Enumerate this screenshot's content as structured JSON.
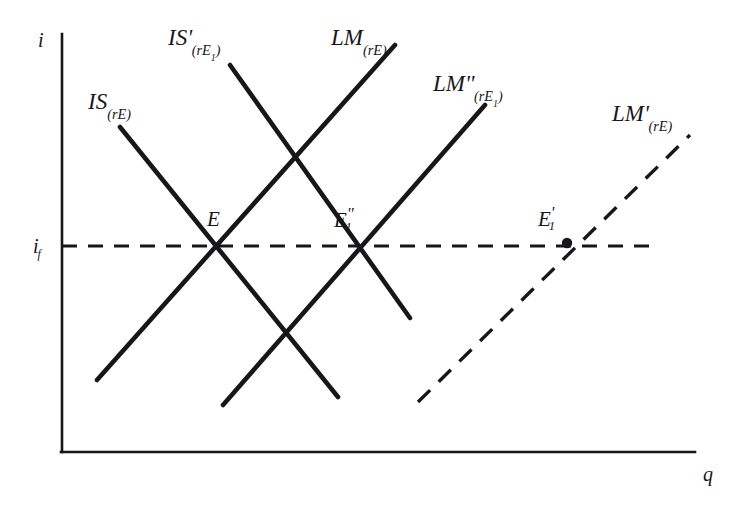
{
  "figure": {
    "type": "is-lm-diagram",
    "background_color": "#ffffff",
    "line_color": "#17171a",
    "axes": {
      "y_axis_label": "i",
      "x_axis_label": "q",
      "y_tick_label": "i",
      "y_tick_sub": "f",
      "origin_px": [
        62,
        452
      ],
      "y_axis_top_px": [
        62,
        34
      ],
      "x_axis_right_px": [
        695,
        452
      ]
    },
    "curves": [
      {
        "id": "IS",
        "label_base": "IS",
        "label_prime": "",
        "label_sub": "(rE)",
        "style": "solid",
        "slope": "negative",
        "from_px": [
          120,
          127
        ],
        "to_px": [
          338,
          397
        ],
        "label_px": [
          88,
          92
        ]
      },
      {
        "id": "IS-prime",
        "label_base": "IS",
        "label_prime": "'",
        "label_sub": "(rE1)",
        "style": "solid",
        "slope": "negative",
        "from_px": [
          230,
          65
        ],
        "to_px": [
          410,
          318
        ],
        "label_px": [
          168,
          27
        ]
      },
      {
        "id": "LM",
        "label_base": "LM",
        "label_prime": "",
        "label_sub": "(rE)",
        "style": "solid",
        "slope": "positive",
        "from_px": [
          97,
          380
        ],
        "to_px": [
          395,
          45
        ],
        "label_px": [
          333,
          27
        ]
      },
      {
        "id": "LM-double-prime",
        "label_base": "LM",
        "label_prime": "''",
        "label_sub": "(rE1)",
        "style": "solid",
        "slope": "positive",
        "from_px": [
          223,
          405
        ],
        "to_px": [
          485,
          105
        ],
        "label_px": [
          434,
          73
        ]
      },
      {
        "id": "LM-prime",
        "label_base": "LM",
        "label_prime": "'",
        "label_sub": "(rE)",
        "style": "dashed",
        "slope": "positive",
        "from_px": [
          418,
          402
        ],
        "to_px": [
          690,
          135
        ],
        "label_px": [
          613,
          103
        ]
      }
    ],
    "guide_line": {
      "id": "full-employment-interest-rate-line",
      "style": "dashed",
      "orientation": "horizontal",
      "y_px": 246,
      "from_x_px": 62,
      "to_x_px": 657
    },
    "points": [
      {
        "id": "E",
        "label_base": "E",
        "label_sub": "",
        "label_prime": "",
        "at_px": [
          222,
          246
        ],
        "label_px": [
          206,
          208
        ],
        "marker": false
      },
      {
        "id": "E1-double-prime",
        "label_base": "E",
        "label_sub": "1",
        "label_prime": "''",
        "at_px": [
          352,
          246
        ],
        "label_px": [
          334,
          206
        ],
        "marker": false
      },
      {
        "id": "E1-prime",
        "label_base": "E",
        "label_sub": "1",
        "label_prime": "'",
        "at_px": [
          567,
          243
        ],
        "label_px": [
          538,
          205
        ],
        "marker": true
      }
    ]
  }
}
